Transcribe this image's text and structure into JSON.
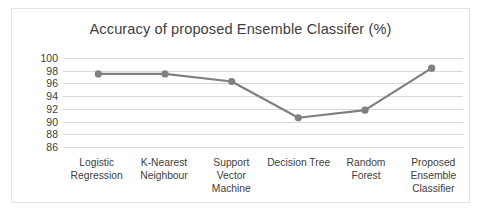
{
  "chart_data": {
    "type": "line",
    "title": "Accuracy of proposed Ensemble Classifer (%)",
    "xlabel": "",
    "ylabel": "",
    "ylim": [
      86,
      100
    ],
    "ytick_step": 2,
    "yticks": [
      100,
      98,
      96,
      94,
      92,
      90,
      88,
      86
    ],
    "grid": true,
    "legend": "none",
    "categories": [
      "Logistic Regression",
      "K-Nearest Neighbour",
      "Support Vector Machine",
      "Decision Tree",
      "Random Forest",
      "Proposed Ensemble Classifier"
    ],
    "category_lines": [
      [
        "Logistic",
        "Regression"
      ],
      [
        "K-Nearest",
        "Neighbour"
      ],
      [
        "Support",
        "Vector",
        "Machine"
      ],
      [
        "Decision Tree"
      ],
      [
        "Random",
        "Forest"
      ],
      [
        "Proposed",
        "Ensemble",
        "Classifier"
      ]
    ],
    "values": [
      97.5,
      97.5,
      96.3,
      90.6,
      91.8,
      98.4
    ],
    "series": [
      {
        "name": "Accuracy (%)",
        "values": [
          97.5,
          97.5,
          96.3,
          90.6,
          91.8,
          98.4
        ]
      }
    ],
    "colors": {
      "line": "#808080",
      "marker": "#808080",
      "grid": "#d9d9d9",
      "text": "#404040",
      "border": "#e3e3e3",
      "background": "#ffffff"
    },
    "marker_style": "circle",
    "marker_size": 6,
    "line_width": 2.2
  }
}
